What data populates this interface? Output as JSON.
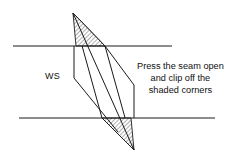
{
  "figure": {
    "background_color": "#ffffff",
    "line_color": "#1a1a1a",
    "hatch_color": "#6e6e6e"
  },
  "labels": {
    "ws": "WS",
    "instruction_line1": "Press the seam open",
    "instruction_line2": "and clip off the",
    "instruction_line3": "shaded corners"
  },
  "geometry": {
    "upper_fabric_line": {
      "x1": 13,
      "y1": 46,
      "x2": 172,
      "y2": 46
    },
    "lower_fabric_line": {
      "x1": 19,
      "y1": 118,
      "x2": 215,
      "y2": 118
    },
    "seam_band": {
      "points": "73,13 105,46 134,150 102,118"
    },
    "seam_center_line": {
      "x1": 73,
      "y1": 13,
      "x2": 134,
      "y2": 150
    },
    "left_vertical_edge": {
      "x1": 74,
      "y1": 46,
      "x2": 74,
      "y2": 78
    },
    "left_diagonal_edge": {
      "x1": 74,
      "y1": 78,
      "x2": 118,
      "y2": 132
    },
    "right_vertical_edge": {
      "x1": 134,
      "y1": 85,
      "x2": 134,
      "y2": 118
    },
    "right_diagonal_edge": {
      "x1": 105,
      "y1": 46,
      "x2": 134,
      "y2": 85
    },
    "top_shaded_triangle": {
      "points": "73,13 105,46 76,46"
    },
    "bottom_shaded_triangle": {
      "points": "134,150 102,118 131,118"
    }
  }
}
